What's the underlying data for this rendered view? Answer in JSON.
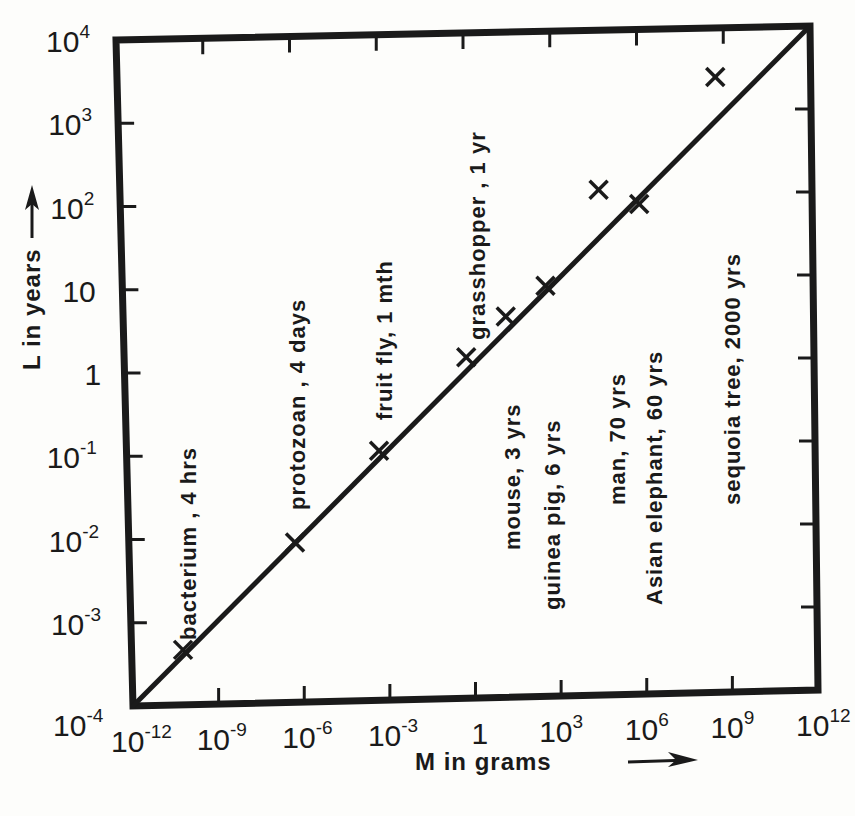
{
  "chart_data": {
    "type": "scatter",
    "title": "",
    "xlabel": "M in grams",
    "ylabel": "L in years",
    "x_scale": "log",
    "y_scale": "log",
    "xlim": [
      1e-12,
      1000000000000.0
    ],
    "ylim": [
      0.0001,
      10000.0
    ],
    "grid": false,
    "x_ticks": [
      {
        "base": "10",
        "exp": "-12",
        "value": -12
      },
      {
        "base": "10",
        "exp": "-9",
        "value": -9
      },
      {
        "base": "10",
        "exp": "-6",
        "value": -6
      },
      {
        "base": "10",
        "exp": "-3",
        "value": -3
      },
      {
        "base": "1",
        "exp": "",
        "value": 0
      },
      {
        "base": "10",
        "exp": "3",
        "value": 3
      },
      {
        "base": "10",
        "exp": "6",
        "value": 6
      },
      {
        "base": "10",
        "exp": "9",
        "value": 9
      },
      {
        "base": "10",
        "exp": "12",
        "value": 12
      }
    ],
    "y_ticks": [
      {
        "base": "10",
        "exp": "4",
        "value": 4
      },
      {
        "base": "10",
        "exp": "3",
        "value": 3
      },
      {
        "base": "10",
        "exp": "2",
        "value": 2
      },
      {
        "base": "10",
        "exp": "",
        "value": 1
      },
      {
        "base": "1",
        "exp": "",
        "value": 0
      },
      {
        "base": "10",
        "exp": "-1",
        "value": -1
      },
      {
        "base": "10",
        "exp": "-2",
        "value": -2
      },
      {
        "base": "10",
        "exp": "-3",
        "value": -3
      },
      {
        "base": "10",
        "exp": "-4",
        "value": -4
      }
    ],
    "fit_line": {
      "description": "straight line L proportional to M^(1/3)",
      "from": {
        "log10_M": -12,
        "log10_L": -4
      },
      "to": {
        "log10_M": 12,
        "log10_L": 4
      }
    },
    "points": [
      {
        "label": "bacterium , 4 hrs",
        "name": "bacterium",
        "lifespan": "4 hrs",
        "log10_M": -10.2,
        "log10_L": -3.34
      },
      {
        "label": "protozoan , 4 days",
        "name": "protozoan",
        "lifespan": "4 days",
        "log10_M": -6.2,
        "log10_L": -2.08
      },
      {
        "label": "fruit fly, 1 mth",
        "name": "fruit fly",
        "lifespan": "1 mth",
        "log10_M": -3.2,
        "log10_L": -1.0
      },
      {
        "label": "grasshopper , 1 yr",
        "name": "grasshopper",
        "lifespan": "1 yr",
        "log10_M": -0.1,
        "log10_L": 0.1
      },
      {
        "label": "mouse, 3 yrs",
        "name": "mouse",
        "lifespan": "3 yrs",
        "log10_M": 1.3,
        "log10_L": 0.58
      },
      {
        "label": "guinea pig, 6 yrs",
        "name": "guinea pig",
        "lifespan": "6 yrs",
        "log10_M": 2.7,
        "log10_L": 0.94
      },
      {
        "label": "man, 70 yrs",
        "name": "man",
        "lifespan": "70 yrs",
        "log10_M": 4.6,
        "log10_L": 2.08
      },
      {
        "label": "Asian elephant, 60 yrs",
        "name": "Asian elephant",
        "lifespan": "60 yrs",
        "log10_M": 6.0,
        "log10_L": 1.9
      },
      {
        "label": "sequoia tree, 2000 yrs",
        "name": "sequoia tree",
        "lifespan": "2000 yrs",
        "log10_M": 8.7,
        "log10_L": 3.41
      }
    ],
    "marker": "X",
    "legend": null
  },
  "axes": {
    "x_title": "M in grams",
    "y_title": "L in years",
    "x_arrow": "→",
    "y_arrow": "→"
  },
  "colors": {
    "ink": "#1a1a1a",
    "paper": "#fdfdfb"
  }
}
